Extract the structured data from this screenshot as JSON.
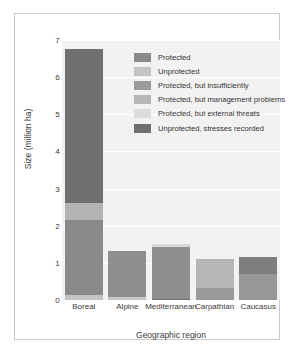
{
  "chart_data": {
    "type": "bar",
    "title": "",
    "subtitle": "",
    "xlabel": "Geographic region",
    "ylabel": "Size (million ha)",
    "ylim": [
      0,
      7
    ],
    "yticks": [
      0,
      1,
      2,
      3,
      4,
      5,
      6,
      7
    ],
    "ytick_labels": [
      "0",
      "1",
      "2",
      "3",
      "4",
      "5",
      "6",
      "7"
    ],
    "grid": true,
    "stacked": true,
    "legend_position": "inside-upper-right",
    "categories": [
      "Boreal",
      "Alpine",
      "Mediterranean",
      "Carpathian",
      "Caucasus"
    ],
    "series": [
      {
        "name": "Protected",
        "color": "#8a8a8a",
        "values": [
          2.02,
          1.24,
          1.4,
          0.0,
          0.7
        ]
      },
      {
        "name": "Unprotected",
        "color": "#c4c4c4",
        "values": [
          0.13,
          0.08,
          0.0,
          0.0,
          0.0
        ]
      },
      {
        "name": "Protected, but insufficiently",
        "color": "#9a9a9a",
        "values": [
          0.0,
          0.0,
          0.0,
          0.32,
          0.0
        ]
      },
      {
        "name": "Protected, but management problems",
        "color": "#b3b3b3",
        "values": [
          0.46,
          0.0,
          0.0,
          0.78,
          0.0
        ]
      },
      {
        "name": "Protected, but external threats",
        "color": "#d8d8d8",
        "values": [
          0.0,
          0.0,
          0.07,
          0.0,
          0.0
        ]
      },
      {
        "name": "Unprotected, stresses recorded",
        "color": "#6f6f6f",
        "values": [
          4.14,
          0.0,
          0.03,
          0.0,
          0.46
        ]
      }
    ],
    "bar_totals": [
      6.75,
      1.32,
      1.5,
      1.1,
      1.16
    ],
    "stacks": [
      {
        "category": "Boreal",
        "total": 6.75,
        "segments": [
          {
            "series": "Unprotected",
            "from": 0.0,
            "to": 0.13,
            "color": "#c4c4c4"
          },
          {
            "series": "Protected",
            "from": 0.13,
            "to": 2.15,
            "color": "#8a8a8a"
          },
          {
            "series": "Protected, but management problems",
            "from": 2.15,
            "to": 2.61,
            "color": "#b3b3b3"
          },
          {
            "series": "Unprotected, stresses recorded",
            "from": 2.61,
            "to": 6.75,
            "color": "#6f6f6f"
          }
        ]
      },
      {
        "category": "Alpine",
        "total": 1.32,
        "segments": [
          {
            "series": "Unprotected",
            "from": 0.0,
            "to": 0.08,
            "color": "#c7c7c7"
          },
          {
            "series": "Protected",
            "from": 0.08,
            "to": 1.32,
            "color": "#8f8f8f"
          }
        ]
      },
      {
        "category": "Mediterranean",
        "total": 1.5,
        "segments": [
          {
            "series": "Unprotected, stresses recorded",
            "from": 0.0,
            "to": 0.03,
            "color": "#6f6f6f"
          },
          {
            "series": "Protected",
            "from": 0.03,
            "to": 1.43,
            "color": "#8f8f8f"
          },
          {
            "series": "Protected, but external threats",
            "from": 1.43,
            "to": 1.5,
            "color": "#d8d8d8"
          }
        ]
      },
      {
        "category": "Carpathian",
        "total": 1.1,
        "segments": [
          {
            "series": "Protected, but insufficiently",
            "from": 0.0,
            "to": 0.32,
            "color": "#9a9a9a"
          },
          {
            "series": "Protected, but management problems",
            "from": 0.32,
            "to": 1.1,
            "color": "#b6b6b6"
          }
        ]
      },
      {
        "category": "Caucasus",
        "total": 1.16,
        "segments": [
          {
            "series": "Protected",
            "from": 0.0,
            "to": 0.7,
            "color": "#979797"
          },
          {
            "series": "Unprotected, stresses recorded",
            "from": 0.7,
            "to": 1.16,
            "color": "#7e7e7e"
          }
        ]
      }
    ],
    "legend": [
      {
        "label": "Protected",
        "color": "#8a8a8a"
      },
      {
        "label": "Unprotected",
        "color": "#c4c4c4"
      },
      {
        "label": "Protected, but insufficiently",
        "color": "#9a9a9a"
      },
      {
        "label": "Protected, but management problems",
        "color": "#b6b6b6"
      },
      {
        "label": "Protected, but external threats",
        "color": "#dcdcdc"
      },
      {
        "label": "Unprotected, stresses recorded",
        "color": "#6f6f6f"
      }
    ]
  },
  "colors": {
    "panel_background": "#f2f2f2",
    "gridline": "#ffffff",
    "frame_border": "#c9c9c9",
    "text": "#3a3a3a"
  }
}
